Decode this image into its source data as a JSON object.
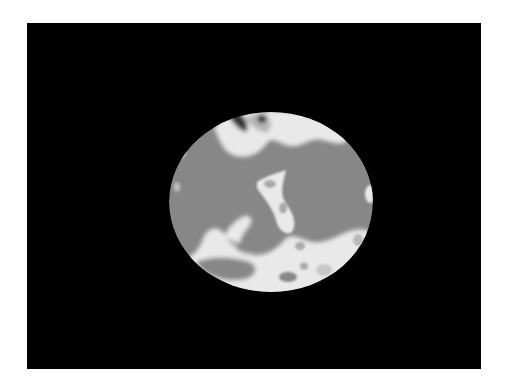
{
  "image": {
    "description": "Grayscale cross-sectional reconstruction: elliptical region on black background",
    "colors": {
      "background": "#ffffff",
      "frame": "#000000",
      "tissue": "#878787",
      "bright": "#e9e9e9",
      "mid": "#b8b8b8",
      "dark": "#1a1a1a"
    },
    "frame": {
      "x": 27,
      "y": 23,
      "width": 454,
      "height": 346
    },
    "ellipse": {
      "cx": 271,
      "cy": 202,
      "rx": 102,
      "ry": 90
    }
  }
}
